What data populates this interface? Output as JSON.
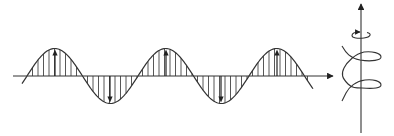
{
  "diagram": {
    "title": "",
    "colors": {
      "background": "#ffffff",
      "stroke": "#333333",
      "hatch": "#444444"
    },
    "wave": {
      "axis": {
        "x_start": 13,
        "x_end": 333,
        "y": 76
      },
      "x_start": 22,
      "x_end": 313,
      "zero_crossing_x": 27,
      "half_period": 55.5,
      "amplitude": 27.5,
      "hatch_spacing": 5.5,
      "peak_arrows_up": [
        55,
        166,
        277
      ],
      "trough_arrows_down": [
        110,
        221
      ]
    },
    "helix": {
      "axis_x": 361,
      "axis_top": 4,
      "axis_bottom": 133,
      "rotation_arrow": {
        "cx": 361,
        "cy": 35,
        "rx": 8,
        "ry": 3.5
      },
      "loops": 2,
      "x_left": 342,
      "x_right": 381
    },
    "icons": {
      "propagation_arrow": "arrow-right-icon",
      "axis_arrow": "arrow-up-icon",
      "rotation": "rotation-arrow-icon"
    }
  }
}
